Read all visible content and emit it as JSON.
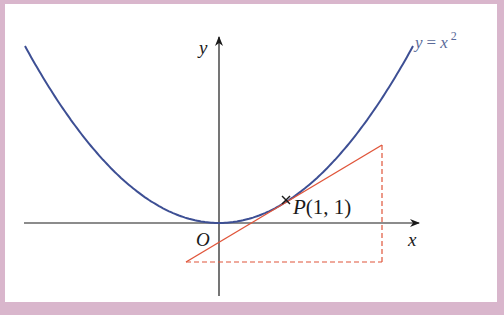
{
  "diagram": {
    "curve_label": {
      "lhs": "y",
      "eq": "=",
      "rhs": "x",
      "exp": "2"
    },
    "axis_labels": {
      "x": "x",
      "y": "y",
      "origin": "O"
    },
    "point_label": {
      "name": "P",
      "coords": "(1, 1)"
    },
    "colors": {
      "curve": "#3d4f94",
      "tangent": "#e0553a",
      "dashed": "#e0553a",
      "axis": "#1a1a1a",
      "frame": "#d9b6cc",
      "label": "#5a6a9a"
    }
  },
  "chart_data": {
    "type": "line",
    "title": "",
    "series": [
      {
        "name": "y = x^2",
        "function": "x^2",
        "color": "#3d4f94"
      },
      {
        "name": "tangent at P(1, 1)",
        "function": "2x - 1",
        "color": "#e0553a"
      }
    ],
    "points": [
      {
        "label": "P(1, 1)",
        "x": 1,
        "y": 1
      }
    ],
    "annotations": [
      "O",
      "P(1, 1)",
      "y = x²",
      "dashed right triangle under tangent"
    ],
    "xlabel": "x",
    "ylabel": "y",
    "grid": false
  }
}
